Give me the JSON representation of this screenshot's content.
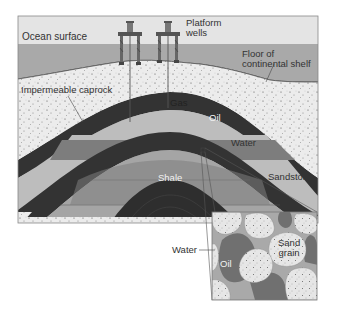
{
  "diagram": {
    "labels": {
      "ocean_surface": "Ocean surface",
      "platform_wells_line1": "Platform",
      "platform_wells_line2": "wells",
      "floor_line1": "Floor of",
      "floor_line2": "continental shelf",
      "caprock": "Impermeable caprock",
      "gas": "Gas",
      "oil": "Oil",
      "water": "Water",
      "shale": "Shale",
      "sandstone": "Sandstone"
    },
    "inset": {
      "water": "Water",
      "oil": "Oil",
      "sand_line1": "Sand",
      "sand_line2": "grain"
    },
    "colors": {
      "sky": "#e4e4e4",
      "ocean": "#a9a9a9",
      "sediment": "#ececec",
      "caprock": "#333333",
      "gas": "#bdbdbd",
      "oil": "#7d7d7d",
      "water": "#a5a5a5",
      "shale": "#2e2e2e"
    }
  }
}
